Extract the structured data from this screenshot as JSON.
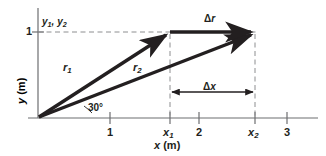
{
  "figure": {
    "type": "vector-displacement-diagram",
    "background_color": "#ffffff",
    "ink_color": "#231f20",
    "axes": {
      "x_axis_title": "x",
      "x_axis_unit": "(m)",
      "y_axis_title": "y",
      "y_axis_unit": "(m)",
      "x_ticks": [
        {
          "label": "1",
          "italic": false
        },
        {
          "label": "x",
          "sub": "1",
          "italic": true
        },
        {
          "label": "2",
          "italic": false
        },
        {
          "label": "x",
          "sub": "2",
          "italic": true
        },
        {
          "label": "3",
          "italic": false
        }
      ],
      "y_ticks": [
        {
          "label": "1",
          "italic": false
        }
      ],
      "x_range": [
        0,
        3.35
      ],
      "y_range": [
        0,
        1.2
      ]
    },
    "labels": {
      "y_levels": "y",
      "y_levels_sub1": "1",
      "y_levels_sep": ", ",
      "y_levels_sub2": "2",
      "y_levels_full": "y1, y2",
      "vector_r1": "r",
      "vector_r1_sub": "1",
      "vector_r2": "r",
      "vector_r2_sub": "2",
      "delta_r": "Δ",
      "delta_r_var": "r",
      "delta_x": "Δ",
      "delta_x_var": "x",
      "angle": "30°"
    },
    "geometry": {
      "origin": {
        "x": 0,
        "y": 0
      },
      "r1_tip": {
        "x": 1.55,
        "y": 1.0
      },
      "r2_tip": {
        "x": 2.61,
        "y": 1.0
      },
      "angle_between_deg": 30,
      "delta_x_span": [
        1.55,
        2.61
      ],
      "delta_r_from": {
        "x": 1.55,
        "y": 1.0
      },
      "delta_r_to": {
        "x": 2.61,
        "y": 1.0
      }
    }
  }
}
